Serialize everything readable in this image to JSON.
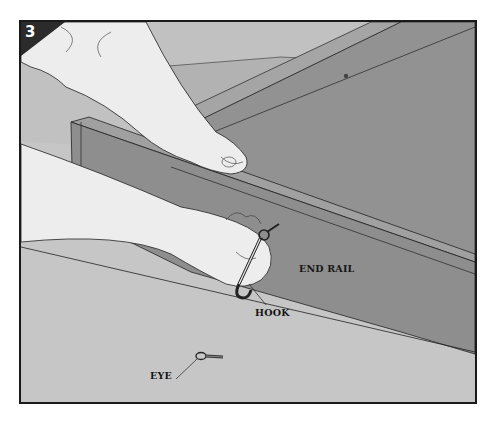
{
  "figure": {
    "step_number": "3",
    "labels": {
      "end_rail": "END RAIL",
      "hook": "HOOK",
      "eye": "EYE"
    },
    "colors": {
      "border": "#1a1a1a",
      "floor": "#c6c6c6",
      "back_panel": "#b7b7b7",
      "rail_face": "#8f8f8f",
      "rail_top": "#a3a3a3",
      "skin": "#ececec",
      "badge": "#2b2b2b"
    }
  }
}
